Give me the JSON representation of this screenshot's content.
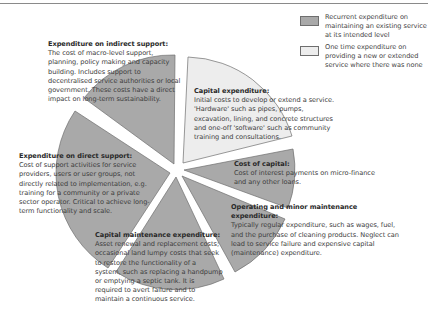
{
  "colors": {
    "recurrent": "#a9a9a9",
    "one_time": "#ededed",
    "slice_border": "#6e6e6e",
    "gap": "#ffffff",
    "text": "#3d3d3d"
  },
  "legend": {
    "items": [
      {
        "text": "Recurrent expenditure on maintaining an existing service at its intended level",
        "swatch": "recurrent"
      },
      {
        "text": "One time expenditure on providing a new or extended service where there was none",
        "swatch": "one_time"
      }
    ]
  },
  "slices": [
    {
      "id": "capital-expenditure",
      "title": "Capital expenditure:",
      "body": "Initial costs to develop or extend a service. 'Hardware' such as pipes, pumps, excavation, lining, and concrete structures and one-off 'software' such as community training and consultations.",
      "type": "one_time"
    },
    {
      "id": "cost-of-capital",
      "title": "Cost of capital:",
      "body": "Cost of interest payments on micro-finance and any other loans.",
      "type": "recurrent"
    },
    {
      "id": "operating-minor-maintenance",
      "title": "Operating and minor maintenance expenditure:",
      "body": "Typically regular expenditure, such as wages, fuel, and the purchase of cleaning products. Neglect can lead to service failure and expensive capital (maintenance) expenditure.",
      "type": "recurrent"
    },
    {
      "id": "capital-maintenance",
      "title": "Capital maintenance expenditure:",
      "body": "Asset renewal and replacement costs; occasional land lumpy costs that seek to restore the functionality of a system, such as replacing a handpump or emptying a septic tank. It is required to avert failure and to maintain a continuous service.",
      "type": "recurrent"
    },
    {
      "id": "direct-support",
      "title": "Expenditure on direct support:",
      "body": "Cost of support activities for service providers, users or user groups, not directly related to implementation, e.g. training for a community or a private sector operator. Critical to achieve long-term functionality and scale.",
      "type": "recurrent"
    },
    {
      "id": "indirect-support",
      "title": "Expenditure on indirect support:",
      "body": "The cost of macro-level support, planning, policy making and capacity building. Includes support to decentralised service authorities or local government. These costs have a direct impact on long-term sustainability.",
      "type": "recurrent"
    }
  ]
}
